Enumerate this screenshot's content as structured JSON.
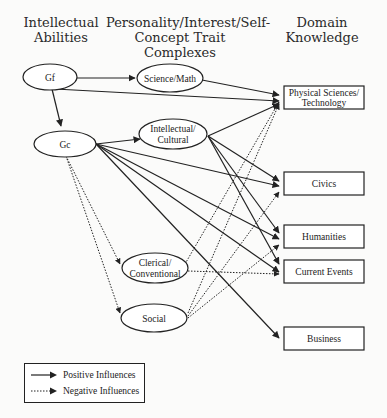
{
  "headers": {
    "col1": [
      "Intellectual",
      "Abilities"
    ],
    "col2": [
      "Personality/Interest/Self-",
      "Concept Trait Complexes"
    ],
    "col3": [
      "Domain",
      "Knowledge"
    ]
  },
  "nodes": {
    "gf": "Gf",
    "gc": "Gc",
    "science_math": "Science/Math",
    "intellectual_cultural": [
      "Intellectual/",
      "Cultural"
    ],
    "clerical_conventional": [
      "Clerical/",
      "Conventional"
    ],
    "social": "Social",
    "physical_sciences": [
      "Physical Sciences/",
      "Technology"
    ],
    "civics": "Civics",
    "humanities": "Humanities",
    "current_events": "Current Events",
    "business": "Business"
  },
  "edges": {
    "positive": [
      [
        "Gf",
        "Science/Math"
      ],
      [
        "Gf",
        "Gc"
      ],
      [
        "Gf",
        "Physical Sciences/Technology"
      ],
      [
        "Science/Math",
        "Physical Sciences/Technology"
      ],
      [
        "Gc",
        "Intellectual/Cultural"
      ],
      [
        "Gc",
        "Civics"
      ],
      [
        "Gc",
        "Humanities"
      ],
      [
        "Gc",
        "Current Events"
      ],
      [
        "Gc",
        "Business"
      ],
      [
        "Intellectual/Cultural",
        "Physical Sciences/Technology"
      ],
      [
        "Intellectual/Cultural",
        "Civics"
      ],
      [
        "Intellectual/Cultural",
        "Humanities"
      ],
      [
        "Intellectual/Cultural",
        "Current Events"
      ]
    ],
    "negative": [
      [
        "Gc",
        "Clerical/Conventional"
      ],
      [
        "Gc",
        "Social"
      ],
      [
        "Clerical/Conventional",
        "Physical Sciences/Technology"
      ],
      [
        "Clerical/Conventional",
        "Current Events"
      ],
      [
        "Social",
        "Physical Sciences/Technology"
      ],
      [
        "Social",
        "Civics"
      ],
      [
        "Social",
        "Humanities"
      ]
    ]
  },
  "legend": {
    "positive": "Positive Influences",
    "negative": "Negative Influences"
  }
}
